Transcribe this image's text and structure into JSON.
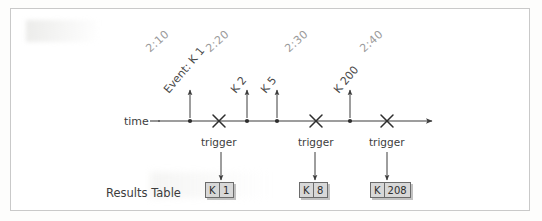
{
  "diagram": {
    "timeline_label": "time",
    "results_table_label": "Results Table",
    "trigger_label": "trigger"
  },
  "timestamps": [
    {
      "text": "2:10",
      "x": 152,
      "y": 42
    },
    {
      "text": "2:20",
      "x": 212,
      "y": 42
    },
    {
      "text": "2:30",
      "x": 291,
      "y": 42
    },
    {
      "text": "2:40",
      "x": 366,
      "y": 42
    }
  ],
  "events": [
    {
      "label": "Event: K 1",
      "x": 171,
      "y": 83,
      "tick_x": 190,
      "arrow_top": 88
    },
    {
      "label": "K 2",
      "x": 238,
      "y": 83,
      "tick_x": 247,
      "arrow_top": 88
    },
    {
      "label": "K 5",
      "x": 268,
      "y": 83,
      "tick_x": 277,
      "arrow_top": 88
    },
    {
      "label": "K 200",
      "x": 341,
      "y": 83,
      "tick_x": 350,
      "arrow_top": 88
    }
  ],
  "timeline": {
    "axis_y": 121,
    "axis_x1": 158,
    "axis_x2": 430,
    "event_dots": [
      190,
      247,
      277,
      350
    ],
    "triggers": [
      {
        "x": 219,
        "label": "trigger"
      },
      {
        "x": 316,
        "label": "trigger"
      },
      {
        "x": 387,
        "label": "trigger"
      }
    ]
  },
  "results": [
    {
      "key": "K",
      "value": "1",
      "box_x": 205,
      "arrow_x": 221
    },
    {
      "key": "K",
      "value": "8",
      "box_x": 299,
      "arrow_x": 315
    },
    {
      "key": "K",
      "value": "208",
      "box_x": 370,
      "arrow_x": 387
    }
  ],
  "results_table": {
    "columns": [
      "key",
      "value"
    ],
    "rows": [
      [
        "K",
        "1"
      ],
      [
        "K",
        "8"
      ],
      [
        "K",
        "208"
      ]
    ]
  }
}
